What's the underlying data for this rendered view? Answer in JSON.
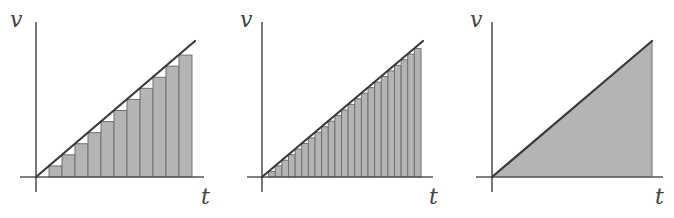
{
  "figure": {
    "panels": [
      {
        "id": "panel-1",
        "kind": "riemann-coarse",
        "x_label": "t",
        "y_label": "v",
        "intervals": 12
      },
      {
        "id": "panel-2",
        "kind": "riemann-fine",
        "x_label": "t",
        "y_label": "v",
        "intervals": 24
      },
      {
        "id": "panel-3",
        "kind": "exact-area",
        "x_label": "t",
        "y_label": "v"
      }
    ],
    "colors": {
      "fill": "#b4b4b4",
      "bar_edge": "#707070",
      "line": "#3a3a3a",
      "axis": "#555555"
    }
  },
  "chart_data": [
    {
      "type": "bar",
      "title": "",
      "xlabel": "t",
      "ylabel": "v",
      "description": "Left-endpoint rectangles under v = k·t, 12 intervals",
      "n_intervals": 12,
      "relative_heights": [
        0,
        1,
        2,
        3,
        4,
        5,
        6,
        7,
        8,
        9,
        10,
        11
      ],
      "line": {
        "from": [
          0,
          0
        ],
        "to": [
          12,
          12
        ]
      }
    },
    {
      "type": "bar",
      "title": "",
      "xlabel": "t",
      "ylabel": "v",
      "description": "Left-endpoint rectangles under v = k·t, 24 intervals",
      "n_intervals": 24,
      "relative_heights": [
        0,
        1,
        2,
        3,
        4,
        5,
        6,
        7,
        8,
        9,
        10,
        11,
        12,
        13,
        14,
        15,
        16,
        17,
        18,
        19,
        20,
        21,
        22,
        23
      ],
      "line": {
        "from": [
          0,
          0
        ],
        "to": [
          24,
          24
        ]
      }
    },
    {
      "type": "area",
      "title": "",
      "xlabel": "t",
      "ylabel": "v",
      "description": "Exact triangular area under v = k·t",
      "line": {
        "from": [
          0,
          0
        ],
        "to": [
          1,
          1
        ]
      }
    }
  ]
}
